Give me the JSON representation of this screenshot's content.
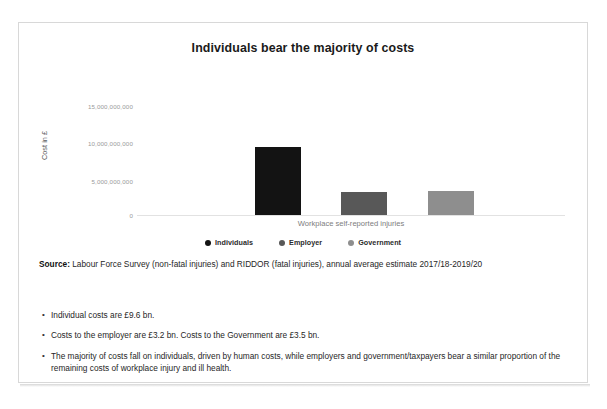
{
  "chart_data": {
    "type": "bar",
    "title": "Individuals bear the majority of costs",
    "categories": [
      "Workplace self-reported injuries"
    ],
    "series": [
      {
        "name": "Individuals",
        "values": [
          9600000000
        ],
        "color": "#131313"
      },
      {
        "name": "Employer",
        "values": [
          3200000000
        ],
        "color": "#585858"
      },
      {
        "name": "Government",
        "values": [
          3500000000
        ],
        "color": "#8e8e8e"
      }
    ],
    "xlabel": "Workplace self-reported injuries",
    "ylabel": "Cost in £",
    "ylim": [
      0,
      15000000000
    ],
    "yticks": [
      "0",
      "5,000,000,000",
      "10,000,000,000",
      "15,000,000,000"
    ],
    "ytick_labels_top_down": [
      "15,000,000,000",
      "10,000,000,000",
      "5,000,000,000",
      "0"
    ],
    "grid": false,
    "legend_position": "bottom"
  },
  "chart": {
    "title": "Individuals bear the majority of costs",
    "y_axis_label": "Cost in £",
    "x_axis_label": "Workplace self-reported injuries",
    "y_ticks": [
      "15,000,000,000",
      "10,000,000,000",
      "5,000,000,000",
      "0"
    ],
    "legend": [
      {
        "label": "Individuals",
        "color": "#131313"
      },
      {
        "label": "Employer",
        "color": "#585858"
      },
      {
        "label": "Government",
        "color": "#8e8e8e"
      }
    ]
  },
  "source": {
    "label": "Source:",
    "text": " Labour Force Survey (non-fatal injuries) and RIDDOR (fatal injuries), annual average estimate 2017/18-2019/20"
  },
  "bullets": [
    {
      "marker": "•",
      "text": "Individual costs are £9.6 bn."
    },
    {
      "marker": "•",
      "text": "Costs to the employer are £3.2 bn. Costs to the Government are £3.5 bn."
    },
    {
      "marker": "•",
      "text": "The majority of costs fall on individuals, driven by human costs, while employers and government/taxpayers bear a similar proportion of the remaining costs of workplace injury and ill health."
    }
  ]
}
